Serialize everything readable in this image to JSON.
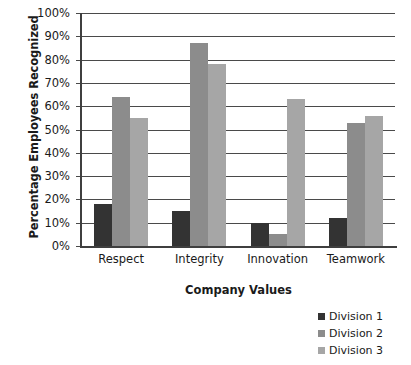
{
  "chart_data": {
    "type": "bar",
    "title": "",
    "subtitle": "",
    "xlabel": "Company Values",
    "ylabel": "Percentage Employees Recognized",
    "categories": [
      "Respect",
      "Integrity",
      "Innovation",
      "Teamwork"
    ],
    "series": [
      {
        "name": "Division 1",
        "color": "#333333",
        "values": [
          18,
          15,
          10,
          12
        ]
      },
      {
        "name": "Division 2",
        "color": "#8c8c8c",
        "values": [
          64,
          87,
          5,
          53
        ]
      },
      {
        "name": "Division 3",
        "color": "#a6a6a6",
        "values": [
          55,
          78,
          63,
          56
        ]
      }
    ],
    "ylim": [
      0,
      100
    ],
    "ytick_values": [
      0,
      10,
      20,
      30,
      40,
      50,
      60,
      70,
      80,
      90,
      100
    ],
    "ytick_labels": [
      "0%",
      "10%",
      "20%",
      "30%",
      "40%",
      "50%",
      "60%",
      "70%",
      "80%",
      "90%",
      "100%"
    ],
    "grid": "horizontal",
    "legend_position": "bottom-right",
    "bar_mode": "grouped"
  }
}
